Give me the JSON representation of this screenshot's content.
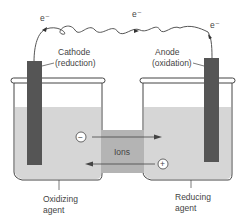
{
  "diagram": {
    "electron_labels": [
      "e⁻",
      "e⁻",
      "e⁻"
    ],
    "cathode": {
      "line1": "Cathode",
      "line2": "(reduction)"
    },
    "anode": {
      "line1": "Anode",
      "line2": "(oxidation)"
    },
    "bridge_label": "Ions",
    "negative_ion": "−",
    "positive_ion": "+",
    "left_solution": {
      "line1": "Oxidizing",
      "line2": "agent"
    },
    "right_solution": {
      "line1": "Reducing",
      "line2": "agent"
    },
    "colors": {
      "solution": "#d6d6d6",
      "electrode": "#555555",
      "bridge": "#b4b4b4",
      "outline": "#444444"
    }
  }
}
